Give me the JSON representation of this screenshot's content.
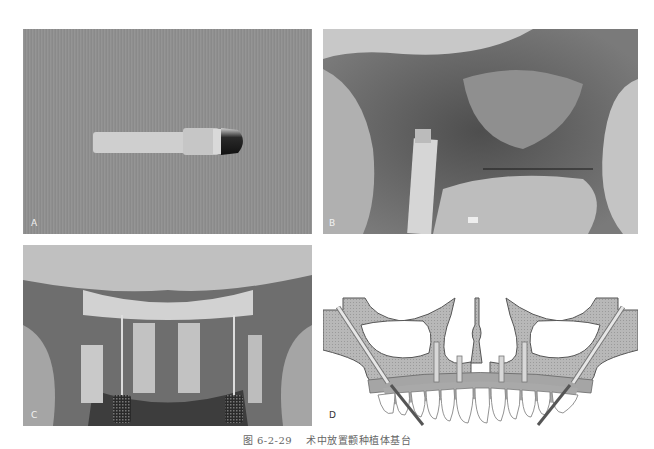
{
  "figure": {
    "caption_number": "图 6-2-29",
    "caption_text": "术中放置颧种植体基台",
    "panels": [
      {
        "label": "A",
        "description": "Zygomatic implant abutment carrier on textured gray background"
      },
      {
        "label": "B",
        "description": "Intraoperative photo: abutment carrier placed in surgical site"
      },
      {
        "label": "C",
        "description": "Intraoperative photo: four abutment carriers and two knurled drivers in maxilla"
      },
      {
        "label": "D",
        "description": "Schematic diagram: maxilla cross-section with two zygomatic and four anterior implants supporting full-arch prosthesis"
      }
    ]
  },
  "colors": {
    "bone_fill": "#b5b5b5",
    "bone_outline": "#555555",
    "gum_fill": "#a8a8a8",
    "tooth_fill": "#ffffff",
    "driver_line": "#555555"
  }
}
